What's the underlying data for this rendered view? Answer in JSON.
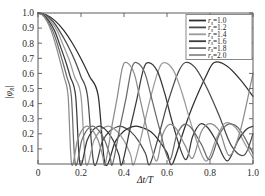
{
  "figure": {
    "background": "#ffffff",
    "frame_color": "#5a5a5a"
  },
  "axes": {
    "x_title": "Δt/T",
    "y_title": "|φᴿ|",
    "y_title_main": "|φ",
    "y_title_sub": "R",
    "y_title_end": "|",
    "x_ticks": [
      "0",
      "0.2",
      "0.4",
      "0.6",
      "0.8",
      "1.0"
    ],
    "y_ticks": [
      "1.0",
      "0.9",
      "0.8",
      "0.7",
      "0.6",
      "0.5",
      "0.4",
      "0.3",
      "0.2",
      "0.1"
    ]
  },
  "legend": {
    "param_symbol": "r",
    "param_sub": "s",
    "equals": "=",
    "entries": [
      {
        "label": "1.0",
        "color": "#2e2e2e"
      },
      {
        "label": "1.2",
        "color": "#4a4a4a"
      },
      {
        "label": "1.4",
        "color": "#9a9a9a"
      },
      {
        "label": "1.6",
        "color": "#3a3a3a"
      },
      {
        "label": "1.8",
        "color": "#6a6a6a"
      },
      {
        "label": "2.0",
        "color": "#8c8c8c"
      }
    ]
  },
  "chart_data": {
    "type": "line",
    "title": "",
    "xlabel": "Δt/T",
    "ylabel": "|φ_R|",
    "xlim": [
      0,
      1.0
    ],
    "ylim": [
      0,
      1.0
    ],
    "xticks": [
      0,
      0.2,
      0.4,
      0.6,
      0.8,
      1.0
    ],
    "yticks": [
      0.1,
      0.2,
      0.3,
      0.4,
      0.5,
      0.6,
      0.7,
      0.8,
      0.9,
      1.0
    ],
    "grid": false,
    "legend_position": "upper right",
    "legend_title": "r_s",
    "series": [
      {
        "name": "r_s = 1.0",
        "color": "#2e2e2e",
        "first_null": 0.3125,
        "sidelobe_peak_x": 0.47,
        "sidelobe_peak_y": 0.248,
        "second_null": 0.625,
        "mainlobe2_peak_x": 0.82,
        "mainlobe2_peak_y": 0.672,
        "x": [
          0.0,
          0.04,
          0.08,
          0.12,
          0.16,
          0.2,
          0.24,
          0.28,
          0.3125,
          0.36,
          0.4,
          0.44,
          0.47,
          0.52,
          0.56,
          0.6,
          0.625,
          0.68,
          0.72,
          0.78,
          0.82,
          0.88,
          0.94,
          1.0
        ],
        "y": [
          1.0,
          0.987,
          0.948,
          0.885,
          0.8,
          0.697,
          0.58,
          0.453,
          0.0,
          0.15,
          0.218,
          0.247,
          0.248,
          0.218,
          0.16,
          0.075,
          0.0,
          0.23,
          0.386,
          0.578,
          0.672,
          0.648,
          0.56,
          0.448
        ]
      },
      {
        "name": "r_s = 1.2",
        "color": "#4a4a4a",
        "first_null": 0.2604,
        "sidelobe_peak_x": 0.392,
        "sidelobe_peak_y": 0.248,
        "second_null": 0.521,
        "mainlobe2_peak_x": 0.685,
        "mainlobe2_peak_y": 0.672,
        "x": [
          0.0,
          0.035,
          0.07,
          0.1,
          0.135,
          0.17,
          0.2,
          0.23,
          0.2604,
          0.3,
          0.335,
          0.37,
          0.392,
          0.43,
          0.465,
          0.5,
          0.521,
          0.57,
          0.6,
          0.65,
          0.685,
          0.73,
          0.78,
          0.84,
          0.9,
          0.96,
          1.0
        ],
        "y": [
          1.0,
          0.986,
          0.944,
          0.882,
          0.795,
          0.69,
          0.578,
          0.452,
          0.0,
          0.152,
          0.22,
          0.247,
          0.248,
          0.216,
          0.158,
          0.07,
          0.0,
          0.232,
          0.39,
          0.6,
          0.672,
          0.64,
          0.52,
          0.33,
          0.12,
          0.06,
          0.2
        ]
      },
      {
        "name": "r_s = 1.4",
        "color": "#9a9a9a",
        "first_null": 0.2232,
        "sidelobe_peak_x": 0.336,
        "sidelobe_peak_y": 0.248,
        "second_null": 0.446,
        "mainlobe2_peak_x": 0.588,
        "mainlobe2_peak_y": 0.672,
        "x": [
          0.0,
          0.03,
          0.06,
          0.09,
          0.115,
          0.145,
          0.17,
          0.2,
          0.2232,
          0.26,
          0.29,
          0.315,
          0.336,
          0.37,
          0.4,
          0.43,
          0.446,
          0.49,
          0.52,
          0.56,
          0.588,
          0.63,
          0.67,
          0.72,
          0.78,
          0.83,
          0.87,
          0.92,
          0.96,
          1.0
        ],
        "y": [
          1.0,
          0.986,
          0.944,
          0.88,
          0.795,
          0.69,
          0.578,
          0.45,
          0.0,
          0.155,
          0.222,
          0.247,
          0.248,
          0.214,
          0.155,
          0.065,
          0.0,
          0.24,
          0.42,
          0.62,
          0.672,
          0.62,
          0.47,
          0.23,
          0.02,
          0.17,
          0.27,
          0.24,
          0.14,
          0.04
        ]
      },
      {
        "name": "r_s = 1.6",
        "color": "#3a3a3a",
        "first_null": 0.1953,
        "sidelobe_peak_x": 0.294,
        "sidelobe_peak_y": 0.248,
        "second_null": 0.391,
        "mainlobe2_peak_x": 0.515,
        "mainlobe2_peak_y": 0.672,
        "x": [
          0.0,
          0.026,
          0.052,
          0.078,
          0.1,
          0.126,
          0.15,
          0.175,
          0.1953,
          0.228,
          0.254,
          0.276,
          0.294,
          0.323,
          0.35,
          0.376,
          0.391,
          0.43,
          0.46,
          0.49,
          0.515,
          0.555,
          0.59,
          0.63,
          0.685,
          0.72,
          0.755,
          0.79,
          0.83,
          0.88,
          0.93,
          0.97,
          1.0
        ],
        "y": [
          1.0,
          0.986,
          0.944,
          0.88,
          0.795,
          0.69,
          0.578,
          0.45,
          0.0,
          0.155,
          0.222,
          0.247,
          0.248,
          0.214,
          0.155,
          0.062,
          0.0,
          0.245,
          0.43,
          0.625,
          0.672,
          0.615,
          0.465,
          0.25,
          0.03,
          0.185,
          0.265,
          0.24,
          0.15,
          0.02,
          0.155,
          0.23,
          0.25
        ]
      },
      {
        "name": "r_s = 1.8",
        "color": "#6a6a6a",
        "first_null": 0.1736,
        "sidelobe_peak_x": 0.261,
        "sidelobe_peak_y": 0.248,
        "second_null": 0.347,
        "mainlobe2_peak_x": 0.458,
        "mainlobe2_peak_y": 0.672,
        "x": [
          0.0,
          0.023,
          0.046,
          0.069,
          0.09,
          0.112,
          0.134,
          0.155,
          0.1736,
          0.203,
          0.226,
          0.245,
          0.261,
          0.287,
          0.311,
          0.334,
          0.347,
          0.382,
          0.41,
          0.435,
          0.458,
          0.495,
          0.525,
          0.565,
          0.61,
          0.645,
          0.68,
          0.715,
          0.76,
          0.8,
          0.845,
          0.89,
          0.94,
          1.0
        ],
        "y": [
          1.0,
          0.986,
          0.944,
          0.88,
          0.795,
          0.69,
          0.578,
          0.45,
          0.0,
          0.155,
          0.222,
          0.247,
          0.248,
          0.214,
          0.155,
          0.06,
          0.0,
          0.25,
          0.44,
          0.63,
          0.672,
          0.61,
          0.455,
          0.235,
          0.025,
          0.19,
          0.262,
          0.235,
          0.13,
          0.03,
          0.2,
          0.265,
          0.225,
          0.07
        ]
      },
      {
        "name": "r_s = 2.0",
        "color": "#8c8c8c",
        "first_null": 0.1563,
        "sidelobe_peak_x": 0.235,
        "sidelobe_peak_y": 0.248,
        "second_null": 0.3125,
        "mainlobe2_peak_x": 0.412,
        "mainlobe2_peak_y": 0.672,
        "x": [
          0.0,
          0.021,
          0.042,
          0.062,
          0.081,
          0.101,
          0.121,
          0.14,
          0.1563,
          0.183,
          0.203,
          0.22,
          0.235,
          0.258,
          0.28,
          0.3,
          0.3125,
          0.344,
          0.369,
          0.392,
          0.412,
          0.446,
          0.472,
          0.508,
          0.55,
          0.58,
          0.612,
          0.645,
          0.685,
          0.72,
          0.76,
          0.8,
          0.845,
          0.89,
          0.94,
          1.0
        ],
        "y": [
          1.0,
          0.986,
          0.944,
          0.88,
          0.795,
          0.69,
          0.578,
          0.45,
          0.0,
          0.155,
          0.222,
          0.247,
          0.248,
          0.214,
          0.155,
          0.058,
          0.0,
          0.252,
          0.445,
          0.635,
          0.672,
          0.605,
          0.45,
          0.225,
          0.02,
          0.195,
          0.262,
          0.23,
          0.12,
          0.04,
          0.215,
          0.268,
          0.215,
          0.055,
          0.215,
          0.6
        ]
      }
    ]
  }
}
